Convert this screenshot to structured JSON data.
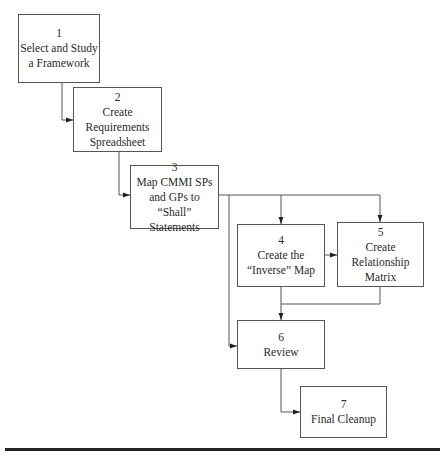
{
  "diagram": {
    "type": "process-flowchart",
    "colors": {
      "stroke": "#555555",
      "text": "#2a2a2a",
      "rule": "#222222",
      "background": "#ffffff"
    },
    "steps": [
      {
        "id": "1",
        "number": "1",
        "lines": [
          "Select and Study",
          "a Framework"
        ]
      },
      {
        "id": "2",
        "number": "2",
        "lines": [
          "Create",
          "Requirements",
          "Spreadsheet"
        ]
      },
      {
        "id": "3",
        "number": "3",
        "lines": [
          "Map CMMI SPs",
          "and GPs to",
          "“Shall”",
          "Statements"
        ]
      },
      {
        "id": "4",
        "number": "4",
        "lines": [
          "Create the",
          "“Inverse” Map"
        ]
      },
      {
        "id": "5",
        "number": "5",
        "lines": [
          "Create",
          "Relationship",
          "Matrix"
        ]
      },
      {
        "id": "6",
        "number": "6",
        "lines": [
          "Review"
        ]
      },
      {
        "id": "7",
        "number": "7",
        "lines": [
          "Final Cleanup"
        ]
      }
    ],
    "edges": [
      {
        "from": "1",
        "to": "2"
      },
      {
        "from": "2",
        "to": "3"
      },
      {
        "from": "3",
        "to": "4"
      },
      {
        "from": "3",
        "to": "5"
      },
      {
        "from": "3",
        "to": "6"
      },
      {
        "from": "4",
        "to": "5"
      },
      {
        "from": "4",
        "to": "6"
      },
      {
        "from": "5",
        "to": "6"
      },
      {
        "from": "6",
        "to": "7"
      }
    ]
  }
}
